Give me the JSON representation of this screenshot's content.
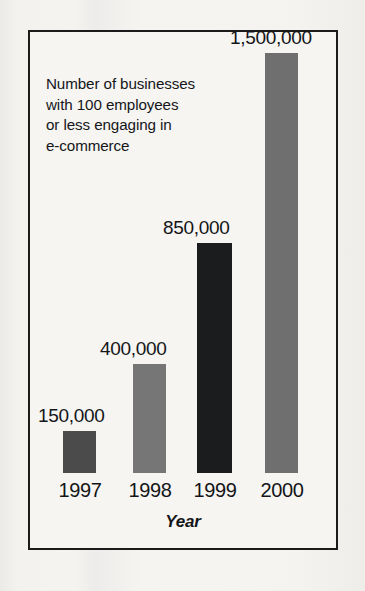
{
  "chart_data": {
    "type": "bar",
    "title": "",
    "annotation_lines": [
      "Number of businesses",
      "with 100 employees",
      "or less engaging in",
      "e-commerce"
    ],
    "categories": [
      "1997",
      "1998",
      "1999",
      "2000"
    ],
    "values": [
      150000,
      400000,
      850000,
      1500000
    ],
    "value_labels": [
      "150,000",
      "400,000",
      "850,000",
      "1,500,000"
    ],
    "xlabel": "Year",
    "ylabel": "",
    "ylim": [
      0,
      1500000
    ],
    "grid": false,
    "legend": false,
    "bar_colors": [
      "#4b4b4c",
      "#767676",
      "#1b1c1e",
      "#6f6f70"
    ],
    "frame_color": "#1b1b1b",
    "background": "#f6f5f2",
    "text_color": "#141518"
  }
}
